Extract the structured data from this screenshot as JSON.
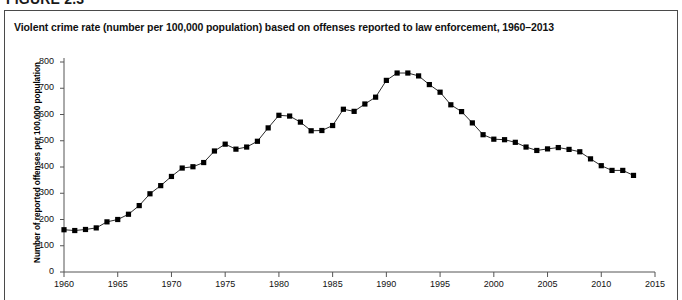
{
  "figure": {
    "header": "FIGURE 2.3",
    "title": "Violent crime rate (number per 100,000 population) based on offenses reported to law enforcement, 1960–2013"
  },
  "axes": {
    "ylabel": "Number of reported offenses per 100,000 population",
    "yticks": [
      "0",
      "100",
      "200",
      "300",
      "400",
      "500",
      "600",
      "700",
      "800"
    ],
    "xticks": [
      "1960",
      "1965",
      "1970",
      "1975",
      "1980",
      "1985",
      "1990",
      "1995",
      "2000",
      "2005",
      "2010",
      "2015"
    ]
  },
  "style": {
    "line_color": "#2b2b2b",
    "marker_color": "#000000",
    "axis_color": "#555555",
    "frame_color": "#4a4a4a",
    "background": "#ffffff"
  },
  "chart_data": {
    "type": "line",
    "title": "Violent crime rate (number per 100,000 population) based on offenses reported to law enforcement, 1960–2013",
    "xlabel": "",
    "ylabel": "Number of reported offenses per 100,000 population",
    "xlim": [
      1960,
      2015
    ],
    "ylim": [
      0,
      800
    ],
    "ytick_step": 100,
    "xtick_step": 5,
    "grid": false,
    "legend": false,
    "marker": "square",
    "x": [
      1960,
      1961,
      1962,
      1963,
      1964,
      1965,
      1966,
      1967,
      1968,
      1969,
      1970,
      1971,
      1972,
      1973,
      1974,
      1975,
      1976,
      1977,
      1978,
      1979,
      1980,
      1981,
      1982,
      1983,
      1984,
      1985,
      1986,
      1987,
      1988,
      1989,
      1990,
      1991,
      1992,
      1993,
      1994,
      1995,
      1996,
      1997,
      1998,
      1999,
      2000,
      2001,
      2002,
      2003,
      2004,
      2005,
      2006,
      2007,
      2008,
      2009,
      2010,
      2011,
      2012,
      2013
    ],
    "values": [
      161,
      158,
      162,
      168,
      191,
      200,
      220,
      253,
      298,
      329,
      364,
      396,
      401,
      417,
      461,
      487,
      468,
      476,
      498,
      549,
      597,
      594,
      571,
      538,
      539,
      558,
      620,
      612,
      640,
      666,
      730,
      758,
      758,
      747,
      714,
      685,
      637,
      611,
      568,
      523,
      506,
      504,
      494,
      476,
      463,
      469,
      474,
      467,
      458,
      431,
      405,
      387,
      387,
      368
    ]
  }
}
